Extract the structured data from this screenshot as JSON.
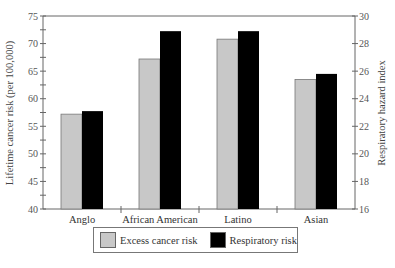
{
  "chart_data": {
    "type": "bar",
    "title": "",
    "categories": [
      "Anglo",
      "African American",
      "Latino",
      "Asian"
    ],
    "series": [
      {
        "name": "Excess cancer risk",
        "axis": "left",
        "color": "#c8c8c8",
        "values": [
          57.2,
          67.2,
          70.8,
          63.5
        ]
      },
      {
        "name": "Respiratory risk",
        "axis": "right",
        "color": "#000000",
        "values": [
          23.1,
          28.9,
          28.9,
          25.8
        ]
      }
    ],
    "xlabel": "",
    "ylabel": "Lifetime cancer risk (per 100,000)",
    "ylabel_right": "Respiratory hazard index",
    "ylim": [
      40,
      75
    ],
    "ylim_right": [
      16,
      30
    ],
    "yticks": [
      40,
      45,
      50,
      55,
      60,
      65,
      70,
      75
    ],
    "yticks_right": [
      16,
      18,
      20,
      22,
      24,
      26,
      28,
      30
    ],
    "grid": false,
    "legend_position": "bottom"
  },
  "axes": {
    "left_title": "Lifetime cancer risk (per 100,000)",
    "right_title": "Respiratory hazard index"
  },
  "legend": {
    "items": [
      {
        "label": "Excess cancer risk",
        "color": "#c8c8c8"
      },
      {
        "label": "Respiratory risk",
        "color": "#000000"
      }
    ]
  }
}
